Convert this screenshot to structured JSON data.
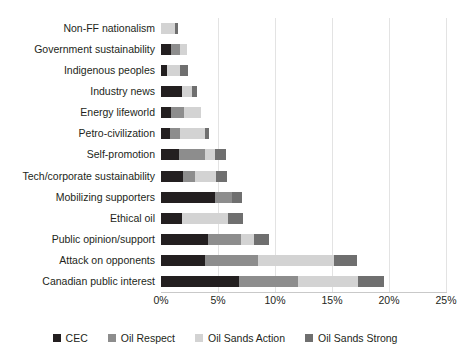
{
  "chart_data": {
    "type": "bar",
    "orientation": "horizontal",
    "stacked": true,
    "title": "",
    "xlabel": "",
    "ylabel": "",
    "xlim": [
      0,
      25
    ],
    "xticks": [
      "0%",
      "5%",
      "10%",
      "15%",
      "20%",
      "25%"
    ],
    "xtick_values": [
      0,
      5,
      10,
      15,
      20,
      25
    ],
    "grid": true,
    "legend_position": "bottom",
    "categories": [
      "Non-FF nationalism",
      "Government sustainability",
      "Indigenous peoples",
      "Industry news",
      "Energy lifeworld",
      "Petro-civilization",
      "Self-promotion",
      "Tech/corporate sustainability",
      "Mobilizing supporters",
      "Ethical oil",
      "Public opinion/support",
      "Attack on opponents",
      "Canadian public interest"
    ],
    "series": [
      {
        "name": "CEC",
        "color": "#231f20",
        "values": [
          0.0,
          0.9,
          0.5,
          1.8,
          0.9,
          0.8,
          1.6,
          1.9,
          4.7,
          1.8,
          4.1,
          3.9,
          6.8
        ]
      },
      {
        "name": "Oil Respect",
        "color": "#8d8d8d",
        "values": [
          0.0,
          0.8,
          0.0,
          0.0,
          1.1,
          0.9,
          2.3,
          1.1,
          1.5,
          0.0,
          2.9,
          4.6,
          5.2
        ]
      },
      {
        "name": "Oil Sands Action",
        "color": "#d3d3d3",
        "values": [
          1.2,
          0.6,
          1.2,
          0.9,
          1.5,
          2.2,
          0.8,
          1.8,
          0.0,
          4.1,
          1.2,
          6.7,
          5.3
        ]
      },
      {
        "name": "Oil Sands Strong",
        "color": "#6f6f6f",
        "values": [
          0.3,
          0.0,
          0.7,
          0.5,
          0.0,
          0.3,
          1.0,
          1.0,
          0.9,
          1.3,
          1.3,
          2.0,
          2.3
        ]
      }
    ]
  },
  "legend": {
    "items": [
      {
        "label": "CEC",
        "color": "#231f20"
      },
      {
        "label": "Oil Respect",
        "color": "#8d8d8d"
      },
      {
        "label": "Oil Sands Action",
        "color": "#d3d3d3"
      },
      {
        "label": "Oil Sands Strong",
        "color": "#6f6f6f"
      }
    ]
  }
}
